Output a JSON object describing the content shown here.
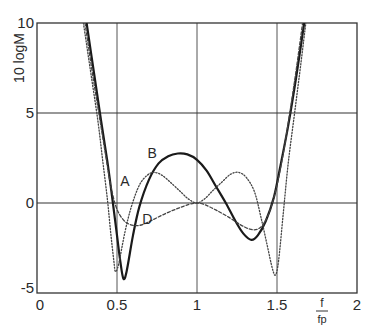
{
  "chart_data": {
    "type": "line",
    "title": "",
    "xlabel": "f / f_p",
    "xlabel_num": "f",
    "xlabel_den": "fp",
    "ylabel": "10 logM",
    "xlim": [
      0,
      2
    ],
    "ylim": [
      -5,
      10
    ],
    "grid": true,
    "x_ticks": [
      {
        "v": 0,
        "label": "0"
      },
      {
        "v": 0.5,
        "label": "0.5"
      },
      {
        "v": 1,
        "label": "1"
      },
      {
        "v": 1.5,
        "label": "1.5"
      },
      {
        "v": 2,
        "label": "2"
      }
    ],
    "y_ticks": [
      {
        "v": -5,
        "label": "-5"
      },
      {
        "v": 0,
        "label": "0"
      },
      {
        "v": 5,
        "label": "5"
      },
      {
        "v": 10,
        "label": "10"
      }
    ],
    "series": [
      {
        "name": "B",
        "style": "solid",
        "points": [
          [
            0.31,
            10
          ],
          [
            0.36,
            7
          ],
          [
            0.4,
            4.6
          ],
          [
            0.44,
            2.3
          ],
          [
            0.47,
            0.3
          ],
          [
            0.5,
            -1.8
          ],
          [
            0.52,
            -3.2
          ],
          [
            0.54,
            -4.2
          ],
          [
            0.56,
            -3.8
          ],
          [
            0.6,
            -1.8
          ],
          [
            0.64,
            -0.2
          ],
          [
            0.7,
            1.3
          ],
          [
            0.76,
            2.2
          ],
          [
            0.82,
            2.6
          ],
          [
            0.88,
            2.75
          ],
          [
            0.94,
            2.7
          ],
          [
            1.0,
            2.4
          ],
          [
            1.06,
            1.8
          ],
          [
            1.12,
            0.9
          ],
          [
            1.18,
            0.0
          ],
          [
            1.24,
            -1.0
          ],
          [
            1.29,
            -1.7
          ],
          [
            1.34,
            -2.05
          ],
          [
            1.38,
            -1.8
          ],
          [
            1.43,
            -1.0
          ],
          [
            1.48,
            0.3
          ],
          [
            1.52,
            2.0
          ],
          [
            1.57,
            4.3
          ],
          [
            1.62,
            7.0
          ],
          [
            1.67,
            10
          ]
        ]
      },
      {
        "name": "A",
        "style": "dotted",
        "points": [
          [
            0.29,
            10
          ],
          [
            0.34,
            7
          ],
          [
            0.38,
            4.6
          ],
          [
            0.41,
            2.4
          ],
          [
            0.44,
            0.2
          ],
          [
            0.46,
            -1.6
          ],
          [
            0.48,
            -3.2
          ],
          [
            0.49,
            -3.8
          ],
          [
            0.51,
            -3.4
          ],
          [
            0.55,
            -1.6
          ],
          [
            0.59,
            -0.2
          ],
          [
            0.64,
            1.0
          ],
          [
            0.69,
            1.55
          ],
          [
            0.73,
            1.7
          ],
          [
            0.78,
            1.55
          ],
          [
            0.84,
            1.1
          ],
          [
            0.9,
            0.6
          ],
          [
            0.95,
            0.2
          ],
          [
            1.0,
            0.0
          ],
          [
            1.05,
            0.25
          ],
          [
            1.1,
            0.7
          ],
          [
            1.16,
            1.2
          ],
          [
            1.21,
            1.6
          ],
          [
            1.26,
            1.7
          ],
          [
            1.31,
            1.4
          ],
          [
            1.36,
            0.6
          ],
          [
            1.4,
            -0.8
          ],
          [
            1.44,
            -2.4
          ],
          [
            1.47,
            -3.6
          ],
          [
            1.49,
            -4.0
          ],
          [
            1.51,
            -3.2
          ],
          [
            1.54,
            -0.5
          ],
          [
            1.57,
            2.2
          ],
          [
            1.61,
            5.0
          ],
          [
            1.65,
            7.8
          ],
          [
            1.68,
            10
          ]
        ]
      },
      {
        "name": "D",
        "style": "dashed",
        "points": [
          [
            0.3,
            10
          ],
          [
            0.35,
            7
          ],
          [
            0.39,
            4.8
          ],
          [
            0.43,
            2.6
          ],
          [
            0.46,
            1.0
          ],
          [
            0.49,
            -0.1
          ],
          [
            0.52,
            -0.7
          ],
          [
            0.56,
            -1.1
          ],
          [
            0.61,
            -1.25
          ],
          [
            0.66,
            -1.2
          ],
          [
            0.72,
            -0.95
          ],
          [
            0.8,
            -0.6
          ],
          [
            0.88,
            -0.3
          ],
          [
            0.95,
            -0.08
          ],
          [
            1.0,
            0.0
          ],
          [
            1.05,
            -0.1
          ],
          [
            1.12,
            -0.4
          ],
          [
            1.2,
            -0.8
          ],
          [
            1.27,
            -1.2
          ],
          [
            1.33,
            -1.45
          ],
          [
            1.38,
            -1.45
          ],
          [
            1.42,
            -1.1
          ],
          [
            1.46,
            -0.3
          ],
          [
            1.5,
            1.0
          ],
          [
            1.54,
            2.8
          ],
          [
            1.58,
            5.0
          ],
          [
            1.62,
            7.4
          ],
          [
            1.66,
            10
          ]
        ]
      }
    ],
    "annotations": [
      {
        "text": "A",
        "x": 0.55,
        "y": 1.2
      },
      {
        "text": "B",
        "x": 0.72,
        "y": 2.8
      },
      {
        "text": "D",
        "x": 0.69,
        "y": -0.9
      }
    ]
  }
}
